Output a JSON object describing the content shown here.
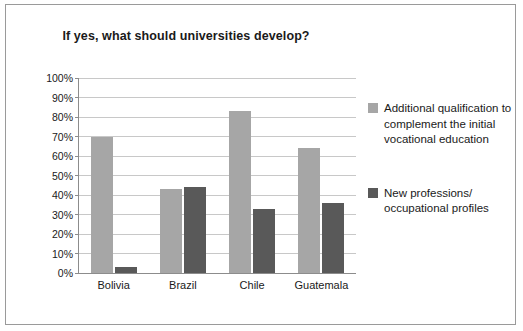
{
  "chart_data": {
    "type": "bar",
    "title": "If yes, what should universities develop?",
    "xlabel": "",
    "ylabel": "",
    "categories": [
      "Bolivia",
      "Brazil",
      "Chile",
      "Guatemala"
    ],
    "series": [
      {
        "name": "Additional qualification to complement the initial vocational education",
        "color": "#a6a6a6",
        "values": [
          70,
          43,
          83,
          64
        ]
      },
      {
        "name": "New professions/ occupational profiles",
        "color": "#595959",
        "values": [
          3,
          44,
          33,
          36
        ]
      }
    ],
    "ylim": [
      0,
      100
    ],
    "yticks": [
      "0%",
      "10%",
      "20%",
      "30%",
      "40%",
      "50%",
      "60%",
      "70%",
      "80%",
      "90%",
      "100%"
    ],
    "grid": true,
    "legend_position": "right"
  }
}
